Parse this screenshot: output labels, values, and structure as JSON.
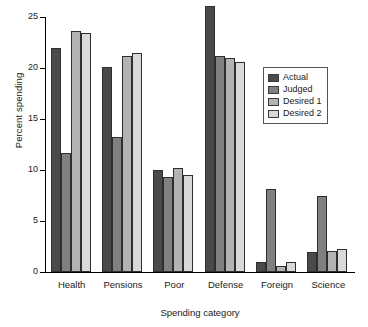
{
  "chart_data": {
    "type": "bar",
    "title": "",
    "xlabel": "Spending category",
    "ylabel": "Percent spending",
    "categories": [
      "Health",
      "Pensions",
      "Poor",
      "Defense",
      "Foreign",
      "Science"
    ],
    "series": [
      {
        "name": "Actual",
        "color": "#4a4a4a",
        "values": [
          22.0,
          20.1,
          10.0,
          26.1,
          1.0,
          2.0
        ]
      },
      {
        "name": "Judged",
        "color": "#808080",
        "values": [
          11.7,
          13.2,
          9.3,
          21.2,
          8.1,
          7.5
        ]
      },
      {
        "name": "Desired 1",
        "color": "#b3b3b3",
        "values": [
          23.6,
          21.2,
          10.2,
          21.0,
          0.6,
          2.1
        ]
      },
      {
        "name": "Desired 2",
        "color": "#d9d9d9",
        "values": [
          23.4,
          21.5,
          9.5,
          20.6,
          1.0,
          2.3
        ]
      }
    ],
    "ylim": [
      0,
      25
    ],
    "yticks": [
      0,
      5,
      10,
      15,
      20,
      25
    ],
    "ytick_labels": [
      "0",
      "5",
      "10",
      "15",
      "20",
      "25"
    ],
    "grid": false,
    "legend_position": "upper-right",
    "legend_entries": [
      "Actual",
      "Judged",
      "Desired 1",
      "Desired 2"
    ]
  }
}
